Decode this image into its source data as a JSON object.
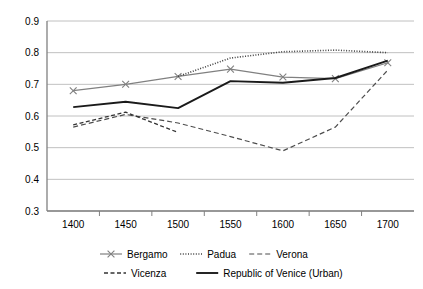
{
  "chart_data": {
    "type": "line",
    "title": "",
    "xlabel": "",
    "ylabel": "",
    "categories": [
      "1400",
      "1450",
      "1500",
      "1550",
      "1600",
      "1650",
      "1700"
    ],
    "ylim": [
      0.3,
      0.9
    ],
    "yticks": [
      "0.3",
      "0.4",
      "0.5",
      "0.6",
      "0.7",
      "0.8",
      "0.9"
    ],
    "grid": true,
    "legend_position": "bottom",
    "series": [
      {
        "name": "Bergamo",
        "style": "solid-with-x-markers",
        "color": "#808080",
        "x": [
          "1400",
          "1450",
          "1500",
          "1550",
          "1600",
          "1650",
          "1700"
        ],
        "values": [
          0.68,
          0.7,
          0.725,
          0.748,
          0.723,
          0.718,
          0.768
        ]
      },
      {
        "name": "Padua",
        "style": "dotted",
        "color": "#404040",
        "x": [
          "1500",
          "1550",
          "1600",
          "1650",
          "1700"
        ],
        "values": [
          0.725,
          0.783,
          0.803,
          0.808,
          0.8
        ]
      },
      {
        "name": "Verona",
        "style": "dashed",
        "color": "#4d4d4d",
        "x": [
          "1400",
          "1450",
          "1500",
          "1550",
          "1600",
          "1650",
          "1700"
        ],
        "values": [
          0.565,
          0.605,
          0.578,
          0.535,
          0.49,
          0.565,
          0.745
        ]
      },
      {
        "name": "Vicenza",
        "style": "dashed-short",
        "color": "#333333",
        "x": [
          "1400",
          "1450",
          "1500"
        ],
        "values": [
          0.572,
          0.612,
          0.548
        ]
      },
      {
        "name": "Republic of Venice (Urban)",
        "style": "solid-thick",
        "color": "#1a1a1a",
        "x": [
          "1400",
          "1450",
          "1500",
          "1550",
          "1600",
          "1650",
          "1700"
        ],
        "values": [
          0.628,
          0.645,
          0.625,
          0.71,
          0.705,
          0.72,
          0.775
        ]
      }
    ]
  },
  "legend": {
    "row1": [
      {
        "label": "Bergamo"
      },
      {
        "label": "Padua"
      },
      {
        "label": "Verona"
      }
    ],
    "row2": [
      {
        "label": "Vicenza"
      },
      {
        "label": "Republic of Venice (Urban)"
      }
    ]
  }
}
